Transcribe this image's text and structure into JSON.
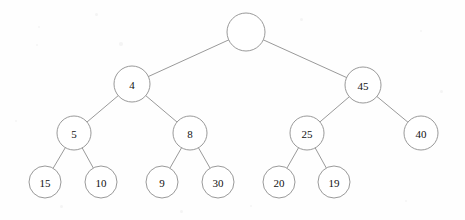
{
  "diagram": {
    "type": "binary-tree",
    "title": "",
    "node_radius_by_level": [
      19,
      18,
      17,
      16
    ],
    "style": {
      "stroke_color": "#8d8d8d",
      "node_fill": "#ffffff",
      "label_color": "#111111",
      "background": "#fefefe"
    },
    "nodes": [
      {
        "id": "root",
        "label": "",
        "x": 246,
        "y": 32,
        "r": 19,
        "level": 0
      },
      {
        "id": "n4",
        "label": "4",
        "x": 132,
        "y": 84,
        "r": 18,
        "level": 1
      },
      {
        "id": "n45",
        "label": "45",
        "x": 363,
        "y": 85,
        "r": 18,
        "level": 1
      },
      {
        "id": "n5",
        "label": "5",
        "x": 74,
        "y": 133,
        "r": 17,
        "level": 2
      },
      {
        "id": "n8",
        "label": "8",
        "x": 190,
        "y": 133,
        "r": 17,
        "level": 2
      },
      {
        "id": "n25",
        "label": "25",
        "x": 307,
        "y": 133,
        "r": 17,
        "level": 2
      },
      {
        "id": "n40",
        "label": "40",
        "x": 421,
        "y": 133,
        "r": 17,
        "level": 2
      },
      {
        "id": "n15",
        "label": "15",
        "x": 45,
        "y": 182,
        "r": 16,
        "level": 3
      },
      {
        "id": "n10",
        "label": "10",
        "x": 101,
        "y": 182,
        "r": 16,
        "level": 3
      },
      {
        "id": "n9",
        "label": "9",
        "x": 162,
        "y": 182,
        "r": 16,
        "level": 3
      },
      {
        "id": "n30",
        "label": "30",
        "x": 218,
        "y": 182,
        "r": 16,
        "level": 3
      },
      {
        "id": "n20",
        "label": "20",
        "x": 279,
        "y": 182,
        "r": 16,
        "level": 3
      },
      {
        "id": "n19",
        "label": "19",
        "x": 334,
        "y": 182,
        "r": 16,
        "level": 3
      }
    ],
    "edges": [
      {
        "from": "root",
        "to": "n4"
      },
      {
        "from": "root",
        "to": "n45"
      },
      {
        "from": "n4",
        "to": "n5"
      },
      {
        "from": "n4",
        "to": "n8"
      },
      {
        "from": "n45",
        "to": "n25"
      },
      {
        "from": "n45",
        "to": "n40"
      },
      {
        "from": "n5",
        "to": "n15"
      },
      {
        "from": "n5",
        "to": "n10"
      },
      {
        "from": "n8",
        "to": "n9"
      },
      {
        "from": "n8",
        "to": "n30"
      },
      {
        "from": "n25",
        "to": "n20"
      },
      {
        "from": "n25",
        "to": "n19"
      }
    ],
    "speckles": [
      {
        "x": 95,
        "y": 13,
        "s": 3
      },
      {
        "x": 38,
        "y": 26,
        "s": 2
      },
      {
        "x": 119,
        "y": 42,
        "s": 4
      },
      {
        "x": 36,
        "y": 44,
        "s": 2
      },
      {
        "x": 300,
        "y": 18,
        "s": 3
      },
      {
        "x": 420,
        "y": 30,
        "s": 2
      },
      {
        "x": 180,
        "y": 210,
        "s": 3
      },
      {
        "x": 250,
        "y": 205,
        "s": 2
      },
      {
        "x": 60,
        "y": 205,
        "s": 3
      },
      {
        "x": 405,
        "y": 200,
        "s": 2
      },
      {
        "x": 440,
        "y": 90,
        "s": 3
      },
      {
        "x": 15,
        "y": 120,
        "s": 2
      }
    ]
  }
}
